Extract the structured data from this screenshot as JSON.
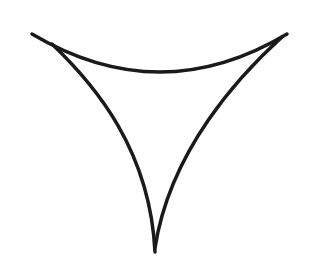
{
  "figure": {
    "stroke_color": "#1a1a1a",
    "background": "#ffffff",
    "stroke_width": 3.5
  }
}
